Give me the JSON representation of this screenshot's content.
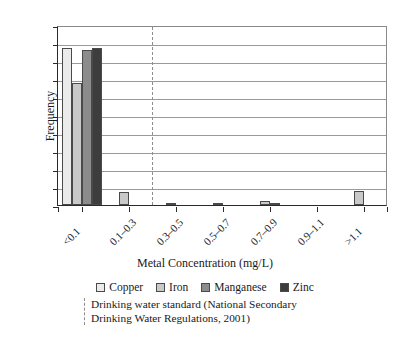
{
  "chart_data": {
    "type": "bar",
    "title": "",
    "xlabel": "Metal Concentration (mg/L)",
    "ylabel": "Frequency",
    "categories": [
      "<0.1",
      "0.1–0.3",
      "0.3–0.5",
      "0.5–0.7",
      "0.7–0.9",
      "0.9–1.1",
      ">1.1"
    ],
    "series": [
      {
        "name": "Copper",
        "color": "#ebebeb",
        "values": [
          87,
          0,
          0,
          0,
          0,
          0,
          0
        ]
      },
      {
        "name": "Iron",
        "color": "#c9c9c9",
        "values": [
          68,
          7,
          1,
          1,
          2,
          0,
          8
        ]
      },
      {
        "name": "Manganese",
        "color": "#8c8c8c",
        "values": [
          86,
          0,
          0,
          0,
          1,
          0,
          0
        ]
      },
      {
        "name": "Zinc",
        "color": "#3d3d3d",
        "values": [
          87,
          0,
          0,
          0,
          0,
          0,
          0
        ]
      }
    ],
    "ylim": [
      0,
      100
    ],
    "yticks": [
      0,
      10,
      20,
      30,
      40,
      50,
      60,
      70,
      80,
      90,
      100
    ],
    "grid": "horizontal",
    "legend_position": "bottom",
    "annotations": [
      {
        "name": "drinking-water-standard",
        "type": "vertical-dashed-line",
        "line1": "Drinking water standard (National Secondary",
        "line2": "Drinking Water Regulations, 2001)"
      }
    ]
  },
  "axis": {
    "y_title": "Frequency",
    "x_title": "Metal Concentration (mg/L)"
  }
}
